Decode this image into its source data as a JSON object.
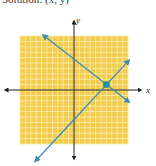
{
  "caption": "Solution: (x, y)",
  "chart_data": {
    "type": "line",
    "title": "Solution: (x, y)",
    "xlabel": "x",
    "ylabel": "y",
    "xlim": [
      -10,
      10
    ],
    "ylim": [
      -10,
      10
    ],
    "grid": true,
    "series": [
      {
        "name": "line-decreasing",
        "points": [
          [
            -5.5,
            10
          ],
          [
            6,
            1
          ],
          [
            10,
            -2.1
          ]
        ],
        "color": "#3a8fb7"
      },
      {
        "name": "line-increasing",
        "points": [
          [
            -7,
            -13
          ],
          [
            6,
            1
          ],
          [
            10,
            5.3
          ]
        ],
        "color": "#3a8fb7"
      }
    ],
    "solution_point": {
      "x": 6,
      "y": 1,
      "color": "#1a9ab0"
    },
    "colors": {
      "grid_fill": "#f2cc4a",
      "grid_lines": "#fbe9a8",
      "axes": "#222222",
      "lines": "#3a8fb7"
    }
  }
}
